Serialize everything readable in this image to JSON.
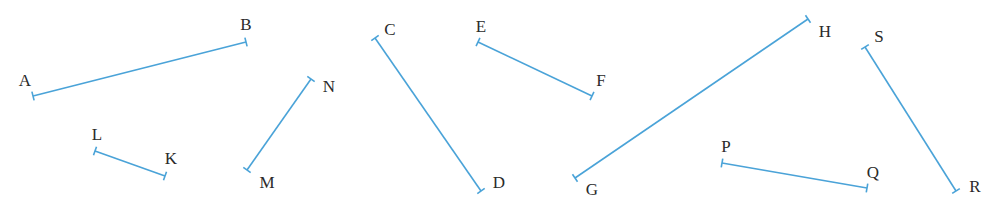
{
  "figure": {
    "width": 998,
    "height": 208,
    "line_color": "#4aa3d8",
    "line_width": 1.6,
    "tick_length": 9,
    "label_color": "#2a2a2a",
    "segments": [
      {
        "name": "AB",
        "p1": {
          "label": "A",
          "x": 33,
          "y": 96,
          "lx": 25,
          "ly": 80
        },
        "p2": {
          "label": "B",
          "x": 246,
          "y": 42,
          "lx": 246,
          "ly": 24
        }
      },
      {
        "name": "LK",
        "p1": {
          "label": "L",
          "x": 95,
          "y": 151,
          "lx": 97,
          "ly": 134
        },
        "p2": {
          "label": "K",
          "x": 165,
          "y": 176,
          "lx": 171,
          "ly": 158
        }
      },
      {
        "name": "NM",
        "p1": {
          "label": "N",
          "x": 311,
          "y": 79,
          "lx": 329,
          "ly": 86
        },
        "p2": {
          "label": "M",
          "x": 247,
          "y": 170,
          "lx": 267,
          "ly": 182
        }
      },
      {
        "name": "CD",
        "p1": {
          "label": "C",
          "x": 375,
          "y": 38,
          "lx": 390,
          "ly": 29
        },
        "p2": {
          "label": "D",
          "x": 481,
          "y": 191,
          "lx": 499,
          "ly": 182
        }
      },
      {
        "name": "EF",
        "p1": {
          "label": "E",
          "x": 478,
          "y": 42,
          "lx": 481,
          "ly": 26
        },
        "p2": {
          "label": "F",
          "x": 592,
          "y": 96,
          "lx": 601,
          "ly": 80
        }
      },
      {
        "name": "GH",
        "p1": {
          "label": "G",
          "x": 575,
          "y": 178,
          "lx": 592,
          "ly": 189
        },
        "p2": {
          "label": "H",
          "x": 808,
          "y": 19,
          "lx": 825,
          "ly": 31
        }
      },
      {
        "name": "PQ",
        "p1": {
          "label": "P",
          "x": 722,
          "y": 163,
          "lx": 726,
          "ly": 146
        },
        "p2": {
          "label": "Q",
          "x": 867,
          "y": 188,
          "lx": 873,
          "ly": 172
        }
      },
      {
        "name": "SR",
        "p1": {
          "label": "S",
          "x": 865,
          "y": 47,
          "lx": 879,
          "ly": 36
        },
        "p2": {
          "label": "R",
          "x": 956,
          "y": 191,
          "lx": 975,
          "ly": 186
        }
      }
    ]
  }
}
